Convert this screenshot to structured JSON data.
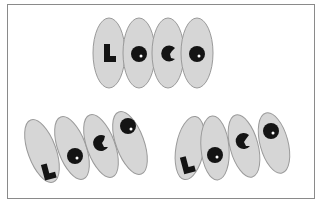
{
  "figure": {
    "word": "LOCO",
    "letters": [
      "L",
      "O",
      "C",
      "O"
    ],
    "colors": {
      "ellipse_fill": "#d6d6d6",
      "ellipse_stroke": "#9a9a9a",
      "glyph": "#141414",
      "frame": "#8a8a8a"
    },
    "groups": [
      {
        "name": "top-upright",
        "arrangement": "upright, horizontal row"
      },
      {
        "name": "bottom-left-tilted",
        "arrangement": "tilted, glyphs rising diagonally"
      },
      {
        "name": "bottom-right-tilted",
        "arrangement": "tilted, glyphs rising diagonally"
      }
    ]
  }
}
